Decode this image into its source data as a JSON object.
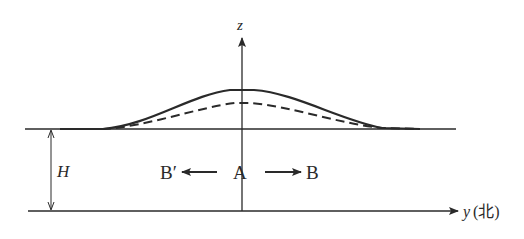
{
  "diagram": {
    "axes": {
      "vertical_label": "z",
      "horizontal_label": "y",
      "horizontal_direction_note": "(北)"
    },
    "depth_label": "H",
    "points": {
      "center": "A",
      "left": "B′",
      "right": "B"
    },
    "curves": [
      {
        "name": "solid-surface-profile",
        "style": "solid",
        "peak_height_px": 39
      },
      {
        "name": "dashed-surface-profile",
        "style": "dashed",
        "peak_height_px": 26
      }
    ],
    "colors": {
      "ink": "#2a2a2a",
      "background": "#ffffff"
    }
  }
}
